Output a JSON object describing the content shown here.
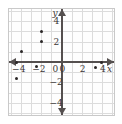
{
  "chart_data": {
    "type": "scatter",
    "title": "",
    "xlabel": "x",
    "ylabel": "y",
    "xlim": [
      -5.2,
      5.2
    ],
    "ylim": [
      -5.2,
      5.2
    ],
    "grid": true,
    "legend": null,
    "x_ticks": [
      -4,
      -2,
      0,
      2,
      4
    ],
    "y_ticks": [
      4,
      2,
      0,
      -2,
      -4
    ],
    "x_tick_labels": [
      "−4",
      "−2",
      "0",
      "2",
      "4"
    ],
    "y_tick_labels": [
      "4",
      "2",
      "0",
      "−2",
      "−4"
    ],
    "points": [
      {
        "x": -2.0,
        "y": 3.0
      },
      {
        "x": -2.0,
        "y": 2.0
      },
      {
        "x": -4.0,
        "y": 1.0
      },
      {
        "x": -4.5,
        "y": 0.0
      },
      {
        "x": -2.5,
        "y": -0.4
      },
      {
        "x": -4.5,
        "y": -1.6
      },
      {
        "x": 3.4,
        "y": -0.5
      },
      {
        "x": 4.0,
        "y": 0.0
      }
    ]
  },
  "axis": {
    "x_name": "x",
    "y_name": "y"
  },
  "colors": {
    "point": "#2b2727",
    "axis": "#55504f",
    "grid": "#dcdcdc",
    "frame": "#c9c9c9",
    "background": "#fefefe"
  }
}
